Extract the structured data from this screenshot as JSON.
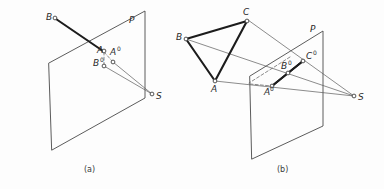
{
  "figure": {
    "title_absent": true,
    "background_color": "#fdfdfd",
    "line_color": "#4a4a4a",
    "bold_line_color": "#1c1c1c",
    "label_color": "#2b2b2b",
    "panels": [
      {
        "id": "a",
        "caption": "(a)",
        "plane_label": "P",
        "object_labels": [
          "B",
          "A"
        ],
        "projection_labels": [
          "A⁰",
          "B⁰"
        ],
        "center_label": "S",
        "points": {
          "B": {
            "label": "B",
            "sup": "",
            "x": 57,
            "y": 12
          },
          "A": {
            "label": "A",
            "sup": "",
            "x": 105,
            "y": 46
          },
          "A0": {
            "label": "A",
            "sup": "0",
            "x": 113,
            "y": 55
          },
          "B0": {
            "label": "B",
            "sup": "0",
            "x": 99,
            "y": 66
          },
          "S": {
            "label": "S",
            "sup": "",
            "x": 156,
            "y": 96
          },
          "P": {
            "label": "P",
            "sup": "",
            "x": 131,
            "y": 20
          }
        }
      },
      {
        "id": "b",
        "caption": "(b)",
        "plane_label": "P",
        "object_labels": [
          "C",
          "B",
          "A"
        ],
        "projection_labels": [
          "A⁰",
          "B⁰",
          "C⁰"
        ],
        "center_label": "S",
        "points": {
          "C": {
            "label": "C",
            "sup": "",
            "x": 246,
            "y": 14
          },
          "B": {
            "label": "B",
            "sup": "",
            "x": 181,
            "y": 35
          },
          "A": {
            "label": "A",
            "sup": "",
            "x": 212,
            "y": 84
          },
          "A0": {
            "label": "A",
            "sup": "0",
            "x": 267,
            "y": 93
          },
          "B0": {
            "label": "B",
            "sup": "0",
            "x": 285,
            "y": 68
          },
          "C0": {
            "label": "C",
            "sup": "0",
            "x": 307,
            "y": 57
          },
          "S": {
            "label": "S",
            "sup": "",
            "x": 359,
            "y": 97
          },
          "P": {
            "label": "P",
            "sup": "",
            "x": 313,
            "y": 29
          }
        }
      }
    ]
  },
  "panel_a": {
    "caption": "(a)",
    "plane_label": "P",
    "label_B": "B",
    "label_A": "A",
    "label_A0": "A",
    "label_A0_sup": "0",
    "label_B0": "B",
    "label_B0_sup": "0",
    "label_S": "S"
  },
  "panel_b": {
    "caption": "(b)",
    "plane_label": "P",
    "label_C": "C",
    "label_B": "B",
    "label_A": "A",
    "label_A0": "A",
    "label_A0_sup": "0",
    "label_B0": "B",
    "label_B0_sup": "0",
    "label_C0": "C",
    "label_C0_sup": "0",
    "label_S": "S"
  }
}
